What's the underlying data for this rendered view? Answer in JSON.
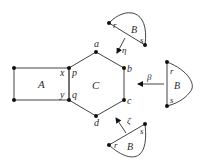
{
  "diagram": {
    "colors": {
      "background": "#ffffff",
      "stroke": "#444444",
      "vertex": "#111111",
      "text": "#2a2a2a"
    },
    "regions": {
      "A": {
        "label": "A"
      },
      "C": {
        "label": "C"
      }
    },
    "rectangle_A": {
      "corner_labels": {
        "top_right": "x",
        "bottom_right": "y"
      }
    },
    "hexagon_C": {
      "vertex_labels": {
        "top": "a",
        "upper_right": "b",
        "lower_right": "c",
        "bottom": "d",
        "upper_left": "p",
        "lower_left": "q"
      }
    },
    "pieces": [
      {
        "id": "top",
        "label": "B",
        "r": "r",
        "s": "s",
        "map_label": "η"
      },
      {
        "id": "right",
        "label": "B",
        "r": "r",
        "s": "s",
        "map_label": "β"
      },
      {
        "id": "bottom",
        "label": "B",
        "r": "r",
        "s": "s",
        "map_label": "ζ"
      }
    ]
  }
}
